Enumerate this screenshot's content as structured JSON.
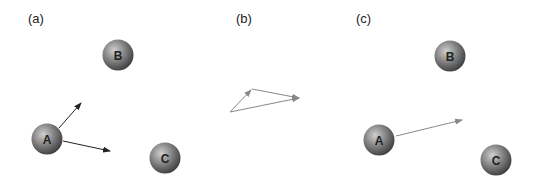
{
  "panels": [
    {
      "label": "(a)",
      "spheres": [
        {
          "name": "A",
          "cx": 47,
          "cy": 139
        },
        {
          "name": "B",
          "cx": 118,
          "cy": 55
        },
        {
          "name": "C",
          "cx": 165,
          "cy": 158
        }
      ],
      "arrows": [
        {
          "from": [
            59,
            128
          ],
          "to": [
            81,
            103
          ]
        },
        {
          "from": [
            63,
            141
          ],
          "to": [
            110,
            151
          ]
        }
      ]
    },
    {
      "label": "(b)",
      "arrows": [
        {
          "from": [
            230,
            112
          ],
          "to": [
            251,
            90
          ]
        },
        {
          "from": [
            252,
            89
          ],
          "to": [
            299,
            98
          ]
        },
        {
          "from": [
            230,
            112
          ],
          "to": [
            299,
            98
          ]
        }
      ]
    },
    {
      "label": "(c)",
      "spheres": [
        {
          "name": "A",
          "cx": 379,
          "cy": 140
        },
        {
          "name": "B",
          "cx": 450,
          "cy": 56
        },
        {
          "name": "C",
          "cx": 496,
          "cy": 160
        }
      ],
      "arrows": [
        {
          "from": [
            396,
            136
          ],
          "to": [
            462,
            120
          ]
        }
      ]
    }
  ],
  "colors": {
    "sphere_dark": "#3a3a3a",
    "sphere_light": "#b8b8b8",
    "arrow_dark": "#222222",
    "arrow_gray": "#888888"
  }
}
